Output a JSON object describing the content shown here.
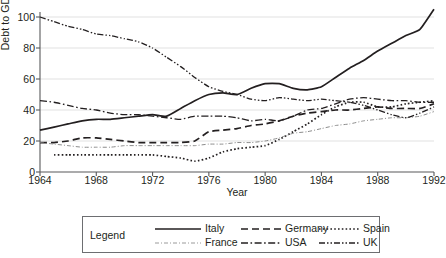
{
  "chart_data": {
    "type": "line",
    "title": "",
    "subtitle": "",
    "xlabel": "Year",
    "ylabel": "Debt to GDP",
    "xlim": [
      1964,
      1992
    ],
    "ylim": [
      0,
      100
    ],
    "ytick_labels": [
      "0",
      "20",
      "40",
      "60",
      "80",
      "100"
    ],
    "ytick_values": [
      0,
      20,
      40,
      60,
      80,
      100
    ],
    "xtick_labels": [
      "1964",
      "1968",
      "1972",
      "1976",
      "1980",
      "1984",
      "1988",
      "1992"
    ],
    "xtick_values": [
      1964,
      1968,
      1972,
      1976,
      1980,
      1984,
      1988,
      1992
    ],
    "grid": "horizontal",
    "legend_position": "bottom",
    "legend_title": "Legend",
    "x": [
      1964,
      1965,
      1966,
      1967,
      1968,
      1969,
      1970,
      1971,
      1972,
      1973,
      1974,
      1975,
      1976,
      1977,
      1978,
      1979,
      1980,
      1981,
      1982,
      1983,
      1984,
      1985,
      1986,
      1987,
      1988,
      1989,
      1990,
      1991,
      1992
    ],
    "series": [
      {
        "name": "Italy",
        "style": "solid",
        "color": "#231f20",
        "values": [
          27,
          29,
          31,
          33,
          34,
          34,
          35,
          36,
          37,
          36,
          41,
          46,
          50,
          51,
          50,
          54,
          57,
          57,
          54,
          53,
          55,
          61,
          67,
          72,
          78,
          83,
          88,
          92,
          105
        ]
      },
      {
        "name": "Germany",
        "style": "dashed",
        "color": "#231f20",
        "values": [
          19,
          19,
          20,
          22,
          22,
          21,
          20,
          19,
          19,
          19,
          19,
          20,
          26,
          27,
          28,
          30,
          31,
          33,
          36,
          38,
          39,
          40,
          40,
          41,
          42,
          41,
          41,
          41,
          44
        ]
      },
      {
        "name": "Spain",
        "style": "dotted",
        "color": "#231f20",
        "values": [
          null,
          11,
          11,
          11,
          11,
          11,
          11,
          11,
          11,
          10,
          9,
          7,
          9,
          13,
          15,
          16,
          17,
          21,
          26,
          31,
          37,
          42,
          45,
          45,
          42,
          42,
          44,
          45,
          46
        ]
      },
      {
        "name": "France",
        "style": "fine-dash-dot",
        "color": "#8c8c8c",
        "values": [
          19,
          18,
          17,
          16,
          16,
          16,
          17,
          17,
          17,
          17,
          17,
          17,
          18,
          18,
          19,
          19,
          20,
          22,
          25,
          26,
          28,
          30,
          31,
          33,
          34,
          35,
          35,
          36,
          39
        ]
      },
      {
        "name": "USA",
        "style": "dash-dot",
        "color": "#231f20",
        "values": [
          46,
          45,
          43,
          41,
          40,
          38,
          37,
          37,
          36,
          35,
          34,
          36,
          36,
          36,
          35,
          33,
          34,
          33,
          36,
          40,
          41,
          44,
          47,
          48,
          47,
          46,
          46,
          45,
          45
        ]
      },
      {
        "name": "UK",
        "style": "dash-dot-dot",
        "color": "#231f20",
        "values": [
          100,
          97,
          94,
          92,
          89,
          88,
          86,
          84,
          80,
          74,
          68,
          61,
          55,
          52,
          50,
          47,
          46,
          48,
          47,
          46,
          47,
          46,
          45,
          43,
          40,
          37,
          35,
          38,
          42
        ]
      }
    ]
  },
  "legend": {
    "title": "Legend",
    "entries": [
      {
        "label": "Italy",
        "style": "solid"
      },
      {
        "label": "Germany",
        "style": "dashed"
      },
      {
        "label": "Spain",
        "style": "dotted"
      },
      {
        "label": "France",
        "style": "fine-dash-dot"
      },
      {
        "label": "USA",
        "style": "dash-dot"
      },
      {
        "label": "UK",
        "style": "dash-dot-dot"
      }
    ]
  }
}
